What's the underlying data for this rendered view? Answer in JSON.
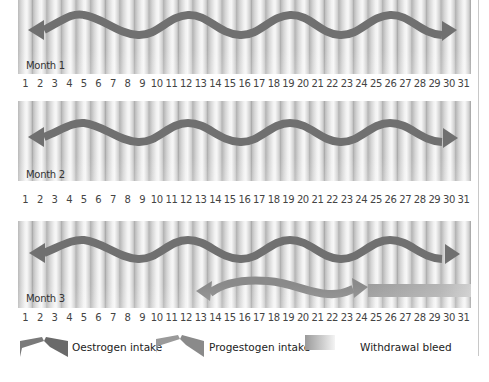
{
  "months": [
    {
      "label": "Month 1"
    },
    {
      "label": "Month 2"
    },
    {
      "label": "Month 3"
    }
  ],
  "days": [
    "1",
    "2",
    "3",
    "4",
    "5",
    "6",
    "7",
    "8",
    "9",
    "10",
    "11",
    "12",
    "13",
    "14",
    "15",
    "16",
    "17",
    "18",
    "19",
    "20",
    "21",
    "22",
    "23",
    "24",
    "25",
    "26",
    "27",
    "28",
    "29",
    "30",
    "31"
  ],
  "legend": {
    "oestrogen": "Oestrogen intake",
    "progestogen": "Progestogen intake",
    "bleed": "Withdrawal bleed"
  },
  "colors": {
    "oestrogen": "#6e6e6e",
    "progestogen": "#8a8a8a",
    "bleed": "#9c9c9c"
  }
}
